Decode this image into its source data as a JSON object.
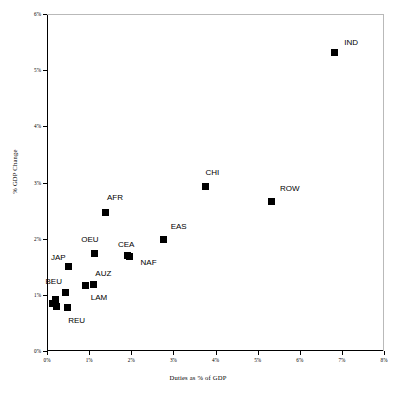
{
  "chart_data": {
    "type": "scatter",
    "title": "",
    "xlabel": "Duties as % of GDP",
    "ylabel": "% GDP Change",
    "xlim": [
      0,
      8
    ],
    "ylim": [
      0,
      6
    ],
    "xticks": [
      "0%",
      "1%",
      "2%",
      "3%",
      "4%",
      "5%",
      "6%",
      "7%",
      "8%"
    ],
    "xtick_values": [
      0,
      1,
      2,
      3,
      4,
      5,
      6,
      7,
      8
    ],
    "yticks": [
      "0%",
      "1%",
      "2%",
      "3%",
      "4%",
      "5%",
      "6%"
    ],
    "ytick_values": [
      0,
      1,
      2,
      3,
      4,
      5,
      6
    ],
    "grid": false,
    "legend": "none",
    "marker_color": "#000000",
    "marker_shape": "square",
    "points": [
      {
        "label": "IND",
        "x": 6.82,
        "y": 5.32,
        "label_dx": 10,
        "label_dy": -10
      },
      {
        "label": "ROW",
        "x": 5.34,
        "y": 2.66,
        "label_dx": 8,
        "label_dy": -14
      },
      {
        "label": "CHI",
        "x": 3.76,
        "y": 2.92,
        "label_dx": 0,
        "label_dy": -15
      },
      {
        "label": "AFR",
        "x": 1.4,
        "y": 2.47,
        "label_dx": 1,
        "label_dy": -15
      },
      {
        "label": "EAS",
        "x": 2.77,
        "y": 1.98,
        "label_dx": 7,
        "label_dy": -14
      },
      {
        "label": "CEA",
        "x": 1.92,
        "y": 1.7,
        "label_dx": -10,
        "label_dy": -12
      },
      {
        "label": "NAF",
        "x": 1.96,
        "y": 1.69,
        "label_dx": 11,
        "label_dy": 6
      },
      {
        "label": "OEU",
        "x": 1.12,
        "y": 1.74,
        "label_dx": -13,
        "label_dy": -14
      },
      {
        "label": "JAP",
        "x": 0.52,
        "y": 1.5,
        "label_dx": -18,
        "label_dy": -10
      },
      {
        "label": "AUZ",
        "x": 1.1,
        "y": 1.18,
        "label_dx": 2,
        "label_dy": -12
      },
      {
        "label": "LAM",
        "x": 0.92,
        "y": 1.16,
        "label_dx": 5,
        "label_dy": 11
      },
      {
        "label": "BEU",
        "x": 0.44,
        "y": 1.05,
        "label_dx": -20,
        "label_dy": -11
      },
      {
        "label": "REU",
        "x": 0.48,
        "y": 0.78,
        "label_dx": 1,
        "label_dy": 13
      },
      {
        "label": "",
        "x": 0.2,
        "y": 0.92,
        "label_dx": 0,
        "label_dy": 0
      },
      {
        "label": "",
        "x": 0.14,
        "y": 0.84,
        "label_dx": 0,
        "label_dy": 0
      },
      {
        "label": "",
        "x": 0.22,
        "y": 0.79,
        "label_dx": 0,
        "label_dy": 0
      }
    ]
  }
}
